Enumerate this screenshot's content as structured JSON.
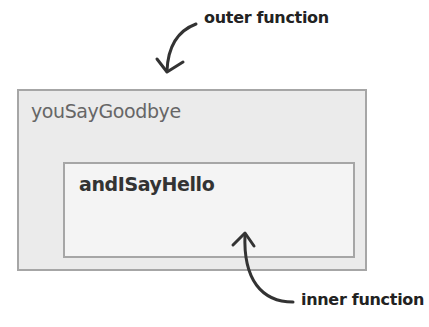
{
  "diagram": {
    "annotations": {
      "outer": "outer function",
      "inner": "inner function"
    },
    "outer_function": {
      "name": "youSayGoodbye"
    },
    "inner_function": {
      "name": "andISayHello"
    },
    "colors": {
      "outer_fill": "#ebebeb",
      "inner_fill": "#f4f4f4",
      "border": "#a6a6a6",
      "arrow": "#333333"
    }
  }
}
